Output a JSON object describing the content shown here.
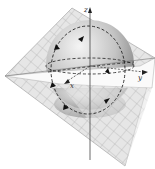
{
  "diagram": {
    "axes": {
      "z_label": "z",
      "x_label": "x",
      "y_label": "y"
    },
    "colors": {
      "plane_fill": "#e4e4e4",
      "plane_grid": "#a8a8a8",
      "sphere_light": "#f2f2f2",
      "sphere_dark": "#8a8a8a",
      "dashed_curve": "#222222",
      "axis": "#444444"
    },
    "elements": [
      "tilted grid plane",
      "shaded sphere",
      "dashed equator ellipse",
      "dashed vertical great circle with direction arrows",
      "coordinate axes x, y, z"
    ]
  }
}
